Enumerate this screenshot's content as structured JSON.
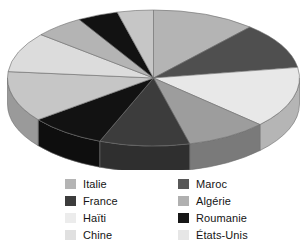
{
  "chart_data": {
    "type": "pie",
    "title": "",
    "subtitle": "",
    "xlabel": "",
    "ylabel": "",
    "grid": false,
    "three_d": true,
    "legend_position": "bottom",
    "legend_columns": 2,
    "start_angle_deg": 0,
    "direction": "clockwise",
    "categories": [
      "Italie",
      "Maroc",
      "Haïti",
      "Algérie",
      "France",
      "Roumanie",
      "Chine",
      "États-Unis"
    ],
    "slices": [
      {
        "label": "Italie",
        "value": 11.5,
        "color": "#b4b4b4"
      },
      {
        "label": "Maroc",
        "value": 11.0,
        "color": "#4f4f4f"
      },
      {
        "label": "Haïti",
        "value": 14.5,
        "color": "#e8e8e8"
      },
      {
        "label": "Algérie",
        "value": 9.0,
        "color": "#9d9d9d"
      },
      {
        "label": "France",
        "value": 10.0,
        "color": "#3c3c3c"
      },
      {
        "label": "Roumanie",
        "value": 8.5,
        "color": "#121212"
      },
      {
        "label": "Chine",
        "value": 12.0,
        "color": "#c6c6c6"
      },
      {
        "label": "États-Unis",
        "value": 9.5,
        "color": "#dcdcdc"
      },
      {
        "label": "Italie",
        "value": 5.5,
        "color": "#b4b4b4"
      },
      {
        "label": "Roumanie",
        "value": 4.5,
        "color": "#121212"
      },
      {
        "label": "Chine",
        "value": 4.0,
        "color": "#c6c6c6"
      }
    ]
  },
  "legend": {
    "columns": [
      {
        "items": [
          {
            "label": "Italie",
            "color": "#b4b4b4",
            "swatch_name": "legend-swatch-italie"
          },
          {
            "label": "France",
            "color": "#3c3c3c",
            "swatch_name": "legend-swatch-france"
          },
          {
            "label": "Haïti",
            "color": "#ececec",
            "swatch_name": "legend-swatch-haiti"
          },
          {
            "label": "Chine",
            "color": "#e0e0e0",
            "swatch_name": "legend-swatch-chine"
          }
        ]
      },
      {
        "items": [
          {
            "label": "Maroc",
            "color": "#585858",
            "swatch_name": "legend-swatch-maroc"
          },
          {
            "label": "Algérie",
            "color": "#b0b0b0",
            "swatch_name": "legend-swatch-algerie"
          },
          {
            "label": "Roumanie",
            "color": "#171717",
            "swatch_name": "legend-swatch-roumanie"
          },
          {
            "label": "États-Unis",
            "color": "#e6e6e6",
            "swatch_name": "legend-swatch-etats-unis"
          }
        ]
      }
    ]
  },
  "colors": {
    "background": "#ffffff",
    "text": "#141414",
    "outline": "#6b6b6b"
  }
}
